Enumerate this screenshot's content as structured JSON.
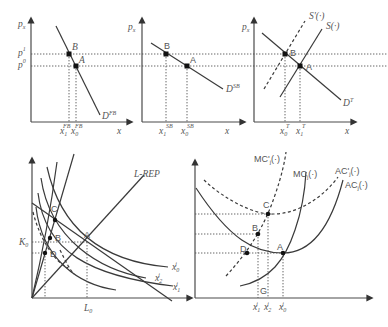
{
  "panels": {
    "top_left": {
      "y_axis": "p_x",
      "x_axis": "x",
      "curve": "D^FB",
      "price_labels": [
        "p_x^1",
        "p_x^0"
      ],
      "quantity_labels": [
        "x_1^FB",
        "x_0^FB"
      ],
      "points": [
        "B",
        "A"
      ]
    },
    "top_middle": {
      "y_axis": "p_x",
      "x_axis": "x",
      "curve": "D^SB",
      "quantity_labels": [
        "x_1^SB",
        "x_0^SB"
      ],
      "points": [
        "B",
        "A"
      ]
    },
    "top_right": {
      "y_axis": "p_x",
      "x_axis": "x",
      "curves": [
        "S'(·)",
        "S(·)",
        "D^T"
      ],
      "quantity_labels": [
        "x_0^T",
        "x_1^T"
      ],
      "points": [
        "B",
        "A"
      ]
    },
    "bottom_left": {
      "line": "L-REP",
      "y_label": "K_0",
      "x_label": "L_0",
      "isoquants": [
        "x_0^j",
        "x_2^j",
        "x_1^j"
      ],
      "points": [
        "C",
        "B",
        "A",
        "D"
      ]
    },
    "bottom_right": {
      "curves": [
        "MC'_j(·)",
        "MC_j(·)",
        "AC'_j(·)",
        "AC_j(·)"
      ],
      "quantity_labels": [
        "x_1^j",
        "x_2^j",
        "x_0^j"
      ],
      "points": [
        "C",
        "B",
        "D",
        "A",
        "G"
      ]
    }
  },
  "text": {
    "px": "p",
    "px_sub": "x",
    "x": "x",
    "B": "B",
    "A": "A",
    "C": "C",
    "D": "D",
    "G": "G",
    "DFB": "D",
    "DFB_sup": "FB",
    "DSB": "D",
    "DSB_sup": "SB",
    "DT": "D",
    "DT_sup": "T",
    "p1_sup": "1",
    "p0_sup": "0",
    "x_sub1": "1",
    "x_sub0": "0",
    "x_sub2": "2",
    "FB": "FB",
    "SB": "SB",
    "T": "T",
    "j": "j",
    "Sprime": "S'(·)",
    "S": "S(·)",
    "LREP": "L-REP",
    "K0": "K",
    "L0": "L",
    "MCprime": "MC'",
    "MC": "MC",
    "ACprime": "AC'",
    "AC": "AC",
    "dotfn": "(·)"
  }
}
